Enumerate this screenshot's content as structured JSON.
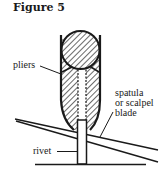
{
  "figure": {
    "title": "Figure 5",
    "labels": {
      "pliers": "pliers",
      "spatula_line1": "spatula",
      "spatula_line2": "or scalpel",
      "spatula_line3": "blade",
      "rivet": "rivet"
    },
    "colors": {
      "ink": "#1a1a1a",
      "background": "#ffffff"
    }
  }
}
